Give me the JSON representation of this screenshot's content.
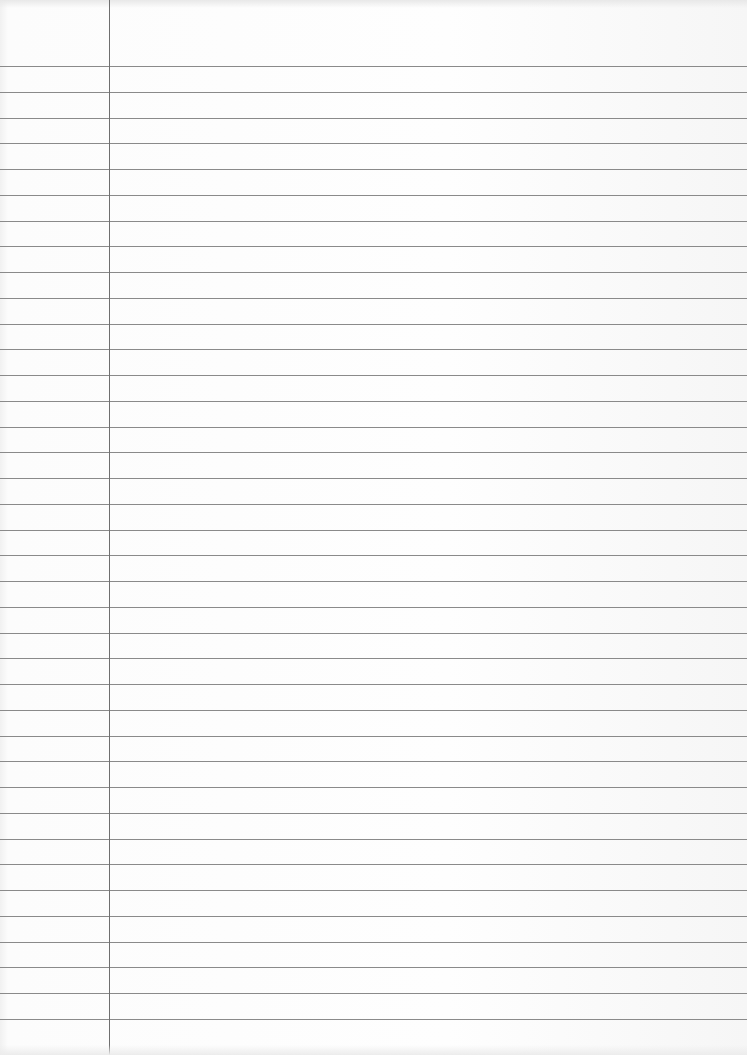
{
  "page": {
    "type": "lined-paper",
    "background_color": "#fbfbfb",
    "rule_color": "#8a8a8a",
    "margin_line_color": "#6f6f6f",
    "margin_line_x": 109,
    "first_rule_y": 66,
    "rule_spacing": 25.75,
    "rule_count": 38,
    "text_content": ""
  }
}
